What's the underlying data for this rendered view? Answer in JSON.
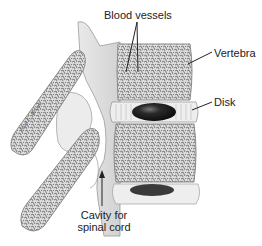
{
  "figure": {
    "labels": {
      "blood_vessels": "Blood vessels",
      "vertebra": "Vertebra",
      "disk": "Disk",
      "cavity_line1": "Cavity for",
      "cavity_line2": "spinal cord"
    },
    "signature": "Jean C. Brook"
  },
  "colors": {
    "bone_fill": "#e6e6e6",
    "bone_edge": "#8a8a8a",
    "spongy": "#7a7a7a",
    "disk_nucleus": "#1a1a1a",
    "text": "#222222"
  }
}
